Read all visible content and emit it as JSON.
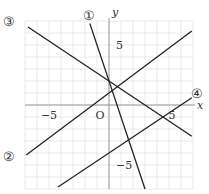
{
  "chart_data": {
    "type": "line",
    "title": "",
    "xlabel": "x",
    "ylabel": "y",
    "origin_label": "O",
    "xlim": [
      -7,
      7
    ],
    "ylim": [
      -7,
      7
    ],
    "grid": true,
    "grid_step": 1,
    "x_tick_labels": [
      {
        "value": -5,
        "label": "−5"
      },
      {
        "value": 5,
        "label": "5"
      }
    ],
    "y_tick_labels": [
      {
        "value": 5,
        "label": "5"
      },
      {
        "value": -5,
        "label": "−5"
      }
    ],
    "series": [
      {
        "name": "①",
        "equation": "y = -3x + 2",
        "slope": -3,
        "intercept": 2,
        "x_range": [
          -1.6,
          3.0
        ]
      },
      {
        "name": "②",
        "equation": "y = 3/4 x + 1",
        "slope": 0.75,
        "intercept": 1,
        "x_range": [
          -6.9,
          6.9
        ]
      },
      {
        "name": "③",
        "equation": "y = -2/3 x + 2",
        "slope": -0.6667,
        "intercept": 2,
        "x_range": [
          -6.75,
          6.9
        ]
      },
      {
        "name": "④",
        "equation": "y = 2/3 x - 4",
        "slope": 0.6667,
        "intercept": -4,
        "x_range": [
          -4.25,
          6.9
        ]
      }
    ],
    "colors": {
      "line": "#222222",
      "grid": "#e4e4e4",
      "axis": "#999999",
      "text": "#333333"
    }
  }
}
